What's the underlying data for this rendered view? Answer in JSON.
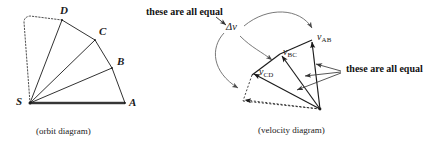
{
  "figure": {
    "ink_color": "#1b1b1b",
    "annotation_color": "#555555",
    "thick_color": "#4a4a4a"
  },
  "orbit_diagram": {
    "caption": "(orbit diagram)",
    "vertices": [
      {
        "id": "S",
        "label": "S",
        "x": 30,
        "y": 103
      },
      {
        "id": "A",
        "label": "A",
        "x": 125,
        "y": 103
      },
      {
        "id": "B",
        "label": "B",
        "x": 112,
        "y": 68
      },
      {
        "id": "C",
        "label": "C",
        "x": 95,
        "y": 40
      },
      {
        "id": "D",
        "label": "D",
        "x": 62,
        "y": 20
      }
    ],
    "label_offsets": [
      {
        "id": "S",
        "label": "S",
        "x": 16,
        "y": 97
      },
      {
        "id": "A",
        "label": "A",
        "x": 129,
        "y": 98
      },
      {
        "id": "B",
        "label": "B",
        "x": 116,
        "y": 57
      },
      {
        "id": "C",
        "label": "C",
        "x": 99,
        "y": 27
      },
      {
        "id": "D",
        "label": "D",
        "x": 61,
        "y": 6
      }
    ],
    "radii": [
      "SA",
      "SB",
      "SC",
      "SD"
    ],
    "chords": [
      "AB",
      "BC",
      "CD"
    ],
    "dotted_projection": {
      "from": "S",
      "to": "D",
      "via_x": 24,
      "via_y": 18
    },
    "base_line": {
      "from": "S",
      "to": "A",
      "style": "thick"
    }
  },
  "velocity_diagram": {
    "caption": "(velocity diagram)",
    "origin": {
      "x": 320,
      "y": 109
    },
    "vectors": [
      {
        "id": "vAB",
        "label": "v",
        "sub": "AB",
        "tip_x": 312,
        "tip_y": 40,
        "label_x": 318,
        "label_y": 38
      },
      {
        "id": "vBC",
        "label": "v",
        "sub": "BC",
        "tip_x": 281,
        "tip_y": 54,
        "label_x": 283,
        "label_y": 52
      },
      {
        "id": "vCD",
        "label": "v",
        "sub": "CD",
        "tip_x": 252,
        "tip_y": 75,
        "label_x": 259,
        "label_y": 72
      },
      {
        "id": "vDE",
        "label": "",
        "sub": "",
        "tip_x": 243,
        "tip_y": 101,
        "label_x": 0,
        "label_y": 0
      }
    ],
    "delta_v": {
      "label": "Δv",
      "x": 229,
      "y": 27
    },
    "dotted_segments": [
      "vCD-tip to vDE-tip",
      "vDE-tip to origin"
    ]
  },
  "annotations": {
    "top_note": "these are all equal",
    "top_note_x": 146,
    "top_note_y": 8,
    "right_note": "these are all equal",
    "right_note_x": 345,
    "right_note_y": 66
  }
}
